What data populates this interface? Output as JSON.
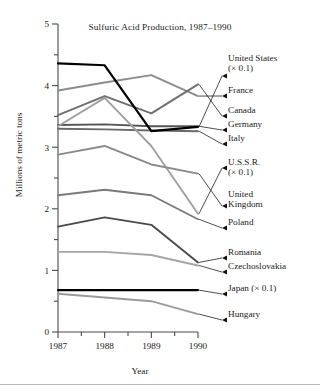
{
  "chart_data": {
    "type": "line",
    "title": "Sulfuric Acid Production, 1987–1990",
    "xlabel": "Year",
    "ylabel": "Millions of metric tons",
    "x": [
      1987,
      1988,
      1989,
      1990
    ],
    "xtick_labels": [
      "1987",
      "1988",
      "1989",
      "1990"
    ],
    "ytick_labels": [
      "0",
      "1",
      "2",
      "3",
      "4",
      "5"
    ],
    "ylim": [
      0,
      5
    ],
    "xlim": [
      1987,
      1990
    ],
    "grid": false,
    "minor_ticks": true,
    "legend_position": "right-inline-arrows",
    "series": [
      {
        "name": "United States",
        "label": "United States\n(× 0.1)",
        "scale_note": "× 0.1",
        "color": "#000000",
        "width": 2.2,
        "values": [
          4.36,
          4.33,
          3.26,
          3.33
        ]
      },
      {
        "name": "France",
        "label": "France",
        "color": "#8c8c8c",
        "width": 1.9,
        "values": [
          3.92,
          4.05,
          4.17,
          3.83
        ]
      },
      {
        "name": "Canada",
        "label": "Canada",
        "color": "#6f6f6f",
        "width": 1.9,
        "values": [
          3.52,
          3.83,
          3.55,
          4.02
        ]
      },
      {
        "name": "Germany",
        "label": "Germany",
        "color": "#555555",
        "width": 1.9,
        "values": [
          3.36,
          3.37,
          3.34,
          3.34
        ]
      },
      {
        "name": "Italy",
        "label": "Italy",
        "color": "#6a6a6a",
        "width": 1.9,
        "values": [
          3.3,
          3.29,
          3.27,
          3.26
        ]
      },
      {
        "name": "U.S.S.R.",
        "label": "U.S.S.R.\n(× 0.1)",
        "scale_note": "× 0.1",
        "color": "#a0a0a0",
        "width": 1.9,
        "values": [
          3.34,
          3.8,
          3.02,
          1.92
        ]
      },
      {
        "name": "United Kingdom",
        "label": "United\nKingdom",
        "color": "#8a8a8a",
        "width": 1.9,
        "values": [
          2.88,
          3.02,
          2.72,
          2.57
        ]
      },
      {
        "name": "Poland",
        "label": "Poland",
        "color": "#7a7a7a",
        "width": 1.9,
        "values": [
          2.22,
          2.31,
          2.22,
          1.83
        ]
      },
      {
        "name": "Romania",
        "label": "Romania",
        "color": "#4a4a4a",
        "width": 1.9,
        "values": [
          1.71,
          1.86,
          1.74,
          1.13
        ]
      },
      {
        "name": "Czechoslovakia",
        "label": "Czechoslovakia",
        "color": "#a5a5a5",
        "width": 1.9,
        "values": [
          1.3,
          1.3,
          1.25,
          1.08
        ]
      },
      {
        "name": "Japan",
        "label": "Japan (× 0.1)",
        "scale_note": "× 0.1",
        "color": "#000000",
        "width": 2.2,
        "values": [
          0.68,
          0.68,
          0.68,
          0.68
        ]
      },
      {
        "name": "Hungary",
        "label": "Hungary",
        "color": "#9a9a9a",
        "width": 1.9,
        "values": [
          0.62,
          0.56,
          0.5,
          0.29
        ]
      }
    ],
    "legend_entries": [
      {
        "text": "United States",
        "sub": "(× 0.1)"
      },
      {
        "text": "France"
      },
      {
        "text": "Canada"
      },
      {
        "text": "Germany"
      },
      {
        "text": "Italy"
      },
      {
        "text": "U.S.S.R.",
        "sub": "(× 0.1)"
      },
      {
        "text": "United",
        "sub": "Kingdom"
      },
      {
        "text": "Poland"
      },
      {
        "text": "Romania"
      },
      {
        "text": "Czechoslovakia"
      },
      {
        "text": "Japan (× 0.1)"
      },
      {
        "text": "Hungary"
      }
    ]
  }
}
